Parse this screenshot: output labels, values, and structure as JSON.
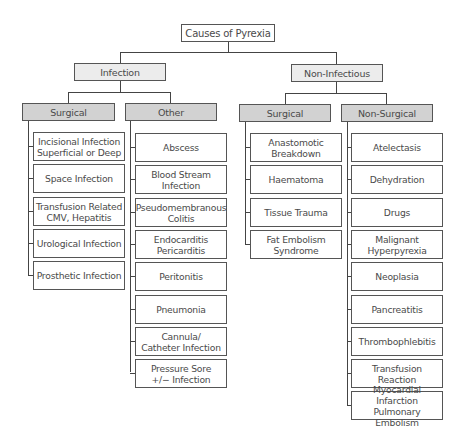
{
  "root": {
    "label": "Causes of Pyrexia"
  },
  "infection": {
    "label": "Infection",
    "surgical": {
      "label": "Surgical",
      "items": [
        "Incisional Infection\nSuperficial or Deep",
        "Space Infection",
        "Transfusion Related\nCMV, Hepatitis",
        "Urological Infection",
        "Prosthetic Infection"
      ]
    },
    "other": {
      "label": "Other",
      "items": [
        "Abscess",
        "Blood Stream\nInfection",
        "Pseudomembranous\nColitis",
        "Endocarditis\nPericarditis",
        "Peritonitis",
        "Pneumonia",
        "Cannula/\nCatheter Infection",
        "Pressure Sore\n+/− Infection"
      ]
    }
  },
  "non_infectious": {
    "label": "Non-Infectious",
    "surgical": {
      "label": "Surgical",
      "items": [
        "Anastomotic\nBreakdown",
        "Haematoma",
        "Tissue Trauma",
        "Fat Embolism\nSyndrome"
      ]
    },
    "non_surgical": {
      "label": "Non-Surgical",
      "items": [
        "Atelectasis",
        "Dehydration",
        "Drugs",
        "Malignant\nHyperpyrexia",
        "Neoplasia",
        "Pancreatitis",
        "Thrombophlebitis",
        "Transfusion Reaction",
        "Myocardial Infarction\nPulmonary Embolism"
      ]
    }
  }
}
